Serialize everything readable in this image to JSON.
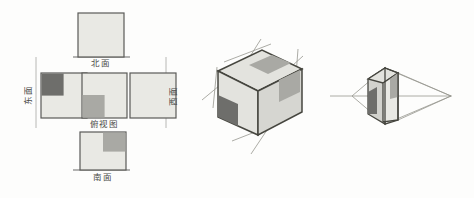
{
  "figure": {
    "background_color": "#fdfdfc",
    "palette": {
      "face_light": "#e9e9e4",
      "patch_mid": "#a9a9a4",
      "patch_dark": "#6e6e6b",
      "patch_light": "#c9c9c4",
      "outline": "#5a5a58",
      "thin_line": "#8d8d8a",
      "text": "#4a4a48"
    }
  },
  "net_diagram": {
    "name": "cross-shaped-net",
    "faces": [
      {
        "id": "north",
        "label": "北面",
        "label_position": "below",
        "patch": "none",
        "fill": "#e9e9e4"
      },
      {
        "id": "east",
        "label": "东面",
        "label_position": "left-rotated",
        "patch": "top-left",
        "patch_color": "#6e6e6b",
        "fill": "#e9e9e4"
      },
      {
        "id": "top-view",
        "label": "俯视图",
        "label_position": "below",
        "patch": "bottom-left",
        "patch_color": "#a9a9a4",
        "fill": "#e9e9e4"
      },
      {
        "id": "west",
        "label": "西面",
        "label_position": "right-rotated",
        "patch": "none",
        "fill": "#e9e9e4"
      },
      {
        "id": "south",
        "label": "南面",
        "label_position": "below",
        "patch": "top-right",
        "patch_color": "#a9a9a4",
        "fill": "#e9e9e4"
      }
    ]
  },
  "isometric_diagram": {
    "name": "isometric-cube",
    "visible_faces": [
      "top",
      "front-left",
      "right"
    ],
    "patches": [
      {
        "face": "top",
        "quadrant": "center-right",
        "color": "#a9a9a4"
      },
      {
        "face": "front-left",
        "quadrant": "bottom-left",
        "color": "#6e6e6b"
      },
      {
        "face": "right",
        "quadrant": "upper-left",
        "color": "#a9a9a4"
      }
    ],
    "construction_lines": true
  },
  "perspective_diagram": {
    "name": "one-point-perspective-cube",
    "visible_faces": [
      "front",
      "left",
      "top"
    ],
    "patches": [
      {
        "face": "front",
        "quadrant": "top-right",
        "color": "#a9a9a4"
      },
      {
        "face": "left",
        "quadrant": "bottom",
        "color": "#6e6e6b"
      }
    ],
    "vanishing_point": "right",
    "horizon_line": true
  }
}
